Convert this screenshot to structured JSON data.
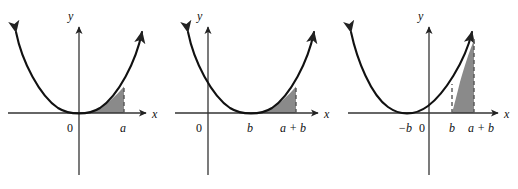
{
  "figure": {
    "panel_count": 3,
    "colors": {
      "curve": "#111111",
      "axis": "#444444",
      "shade_fill": "#8a8a8a",
      "shade_stroke": "#555555",
      "dashed_line": "#555555",
      "background": "#ffffff"
    }
  },
  "panels": [
    {
      "id": "panel-1",
      "name": "parabola-vertex-at-origin",
      "axis": {
        "x_label": "x",
        "y_label": "y"
      },
      "ticks": [
        {
          "name": "origin",
          "label": "0",
          "italic": false
        },
        {
          "name": "upper-limit-a",
          "label": "a",
          "italic": true
        }
      ],
      "curve": {
        "type": "parabola",
        "vertex_x_label": "0",
        "description": "y = x^2 with vertex at origin"
      },
      "shaded_region": {
        "from_label": "0",
        "to_label": "a",
        "dashed_edges": [
          "right"
        ],
        "description": "Area under curve from 0 to a"
      }
    },
    {
      "id": "panel-2",
      "name": "parabola-vertex-at-b",
      "axis": {
        "x_label": "x",
        "y_label": "y"
      },
      "ticks": [
        {
          "name": "origin",
          "label": "0",
          "italic": false
        },
        {
          "name": "vertex-b",
          "label": "b",
          "italic": true
        },
        {
          "name": "upper-limit-a-plus-b",
          "label": "a + b",
          "italic": true
        }
      ],
      "curve": {
        "type": "parabola",
        "vertex_x_label": "b",
        "description": "y = (x - b)^2 with vertex at x = b"
      },
      "shaded_region": {
        "from_label": "b",
        "to_label": "a + b",
        "dashed_edges": [
          "right"
        ],
        "description": "Area under curve from b to a + b"
      }
    },
    {
      "id": "panel-3",
      "name": "parabola-vertex-at-negative-b",
      "axis": {
        "x_label": "x",
        "y_label": "y"
      },
      "ticks": [
        {
          "name": "vertex-negative-b",
          "label": "−b",
          "italic": true
        },
        {
          "name": "origin",
          "label": "0",
          "italic": false
        },
        {
          "name": "lower-limit-b",
          "label": "b",
          "italic": true
        },
        {
          "name": "upper-limit-a-plus-b",
          "label": "a + b",
          "italic": true
        }
      ],
      "curve": {
        "type": "parabola",
        "vertex_x_label": "−b",
        "description": "y = (x + b)^2 with vertex at x = -b"
      },
      "shaded_region": {
        "from_label": "b",
        "to_label": "a + b",
        "dashed_edges": [
          "left",
          "right"
        ],
        "description": "Area under curve from b to a + b"
      }
    }
  ]
}
